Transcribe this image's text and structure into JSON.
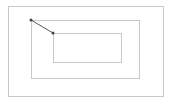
{
  "diagram": {
    "stroke_color": "#c8c8c8",
    "point_color": "#555555",
    "rectangles": [
      {
        "name": "outer",
        "x": 8,
        "y": 6,
        "width": 155,
        "height": 90
      },
      {
        "name": "middle",
        "x": 31,
        "y": 20,
        "width": 108,
        "height": 58
      },
      {
        "name": "inner",
        "x": 53,
        "y": 33,
        "width": 68,
        "height": 29
      }
    ],
    "connector": {
      "x1": 31,
      "y1": 20,
      "x2": 53,
      "y2": 33
    },
    "points": [
      {
        "x": 31,
        "y": 20
      },
      {
        "x": 53,
        "y": 33
      }
    ]
  }
}
